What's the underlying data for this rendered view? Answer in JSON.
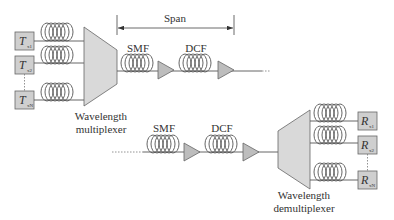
{
  "diagram": {
    "span_label": "Span",
    "upper_chain": {
      "fiber1_label": "SMF",
      "fiber2_label": "DCF"
    },
    "lower_chain": {
      "fiber1_label": "SMF",
      "fiber2_label": "DCF"
    },
    "multiplexer": {
      "label_line1": "Wavelength",
      "label_line2": "multiplexer"
    },
    "demultiplexer": {
      "label_line1": "Wavelength",
      "label_line2": "demultiplexer"
    },
    "transmitters": [
      {
        "letter": "T",
        "sub": "x1"
      },
      {
        "letter": "T",
        "sub": "x2"
      },
      {
        "letter": "T",
        "sub": "xN"
      }
    ],
    "receivers": [
      {
        "letter": "R",
        "sub": "x1"
      },
      {
        "letter": "R",
        "sub": "x2"
      },
      {
        "letter": "R",
        "sub": "xN"
      }
    ],
    "colors": {
      "line": "#555555",
      "fill": "#d9d9d9",
      "box_fill": "#cfcfcf",
      "text": "#333333"
    }
  }
}
